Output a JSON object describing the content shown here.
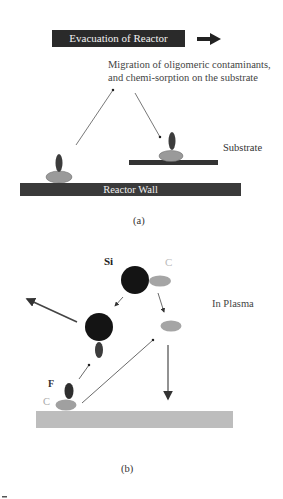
{
  "panel_a": {
    "evacuation_label": "Evacuation of Reactor",
    "note_line1": "Migration of oligomeric contaminants,",
    "note_line2": "and chemi-sorption on the substrate",
    "substrate_label": "Substrate",
    "wall_label": "Reactor Wall",
    "caption": "(a)"
  },
  "panel_b": {
    "si_label": "Si",
    "c_label_top": "C",
    "plasma_label": "In Plasma",
    "f_label": "F",
    "c_label_bottom": "C",
    "caption": "(b)"
  },
  "colors": {
    "dark": "#1a1a1a",
    "bar_dark": "#3a3a3a",
    "ellipse_gray": "#9a9a9a",
    "molecule_dark": "#3c3c3c",
    "surface_gray": "#bdbdbd"
  }
}
